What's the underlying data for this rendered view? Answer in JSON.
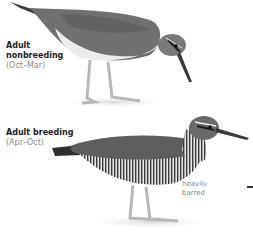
{
  "plates": [
    {
      "id": "nonbreeding",
      "title_line1": "Adult",
      "title_line2": "nonbreeding",
      "period": "(Oct–Mar)"
    },
    {
      "id": "breeding",
      "title": "Adult breeding",
      "period": "(Apr–Oct)",
      "annotation_line1": "heavily",
      "annotation_line2": "barred"
    }
  ],
  "colors": {
    "back_gray": "#6b6b6b",
    "belly_light": "#e9e9e9",
    "legs": "#b8b8b8",
    "text_dark": "#222222",
    "text_muted": "#8a8a8a"
  }
}
